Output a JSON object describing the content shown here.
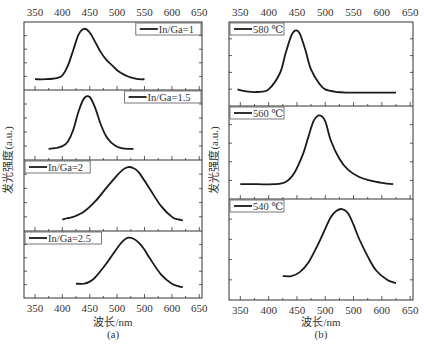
{
  "chart_data": [
    {
      "type": "line",
      "label": "(a)",
      "xlabel": "波长/nm",
      "ylabel": "发光强度(a.u.)",
      "top_ticks": [
        "350",
        "400",
        "450",
        "500",
        "550",
        "600",
        "650"
      ],
      "bottom_ticks": [
        "350",
        "400",
        "450",
        "500",
        "500",
        "600",
        "650"
      ],
      "xlim": [
        330,
        655
      ],
      "grid": false,
      "legend_position": "per-panel",
      "series": [
        {
          "name": "In/Ga=1",
          "legend_side": "right",
          "x": [
            350,
            370,
            390,
            400,
            410,
            420,
            430,
            440,
            450,
            460,
            470,
            480,
            490,
            500,
            510,
            520,
            530,
            540,
            550
          ],
          "y": [
            0.05,
            0.05,
            0.07,
            0.12,
            0.3,
            0.6,
            0.9,
            1.0,
            0.93,
            0.75,
            0.56,
            0.42,
            0.32,
            0.22,
            0.15,
            0.1,
            0.07,
            0.05,
            0.05
          ]
        },
        {
          "name": "In/Ga=1.5",
          "legend_side": "right",
          "x": [
            375,
            390,
            400,
            410,
            420,
            430,
            440,
            450,
            460,
            470,
            480,
            490,
            500,
            510,
            520,
            530
          ],
          "y": [
            0.05,
            0.07,
            0.1,
            0.18,
            0.4,
            0.75,
            0.98,
            1.0,
            0.8,
            0.5,
            0.28,
            0.16,
            0.09,
            0.06,
            0.05,
            0.05
          ]
        },
        {
          "name": "In/Ga=2",
          "legend_side": "left",
          "x": [
            400,
            410,
            420,
            440,
            460,
            480,
            500,
            510,
            520,
            530,
            540,
            560,
            580,
            600,
            610,
            620
          ],
          "y": [
            0.05,
            0.08,
            0.1,
            0.2,
            0.38,
            0.62,
            0.85,
            0.95,
            1.0,
            0.98,
            0.9,
            0.6,
            0.3,
            0.1,
            0.06,
            0.04
          ]
        },
        {
          "name": "In/Ga=2.5",
          "legend_side": "left",
          "x": [
            425,
            440,
            450,
            460,
            480,
            500,
            510,
            520,
            530,
            540,
            550,
            560,
            580,
            600,
            620
          ],
          "y": [
            0.12,
            0.12,
            0.16,
            0.24,
            0.5,
            0.8,
            0.93,
            1.0,
            0.98,
            0.9,
            0.77,
            0.6,
            0.3,
            0.12,
            0.05
          ]
        }
      ]
    },
    {
      "type": "line",
      "label": "(b)",
      "xlabel": "波长/nm",
      "ylabel": "发光强度(a.u.)",
      "top_ticks": [
        "350",
        "400",
        "450",
        "500",
        "550",
        "600",
        "650"
      ],
      "bottom_ticks": [
        "350",
        "400",
        "450",
        "500",
        "500",
        "600",
        "650"
      ],
      "xlim": [
        330,
        655
      ],
      "grid": false,
      "legend_position": "per-panel",
      "series": [
        {
          "name": "580 ℃",
          "legend_side": "left",
          "x": [
            345,
            360,
            380,
            400,
            420,
            430,
            440,
            448,
            455,
            465,
            475,
            490,
            500,
            520,
            540,
            560,
            580,
            600,
            625
          ],
          "y": [
            0.1,
            0.07,
            0.06,
            0.1,
            0.35,
            0.65,
            0.92,
            1.0,
            0.95,
            0.7,
            0.4,
            0.18,
            0.1,
            0.06,
            0.05,
            0.05,
            0.05,
            0.05,
            0.05
          ]
        },
        {
          "name": "560 ℃",
          "legend_side": "left",
          "x": [
            350,
            380,
            410,
            430,
            445,
            460,
            470,
            480,
            490,
            500,
            510,
            525,
            540,
            560,
            580,
            600,
            620
          ],
          "y": [
            0.05,
            0.05,
            0.05,
            0.08,
            0.2,
            0.45,
            0.7,
            0.93,
            1.0,
            0.92,
            0.65,
            0.4,
            0.25,
            0.15,
            0.1,
            0.07,
            0.05
          ]
        },
        {
          "name": "540 ℃",
          "legend_side": "left",
          "x": [
            425,
            440,
            455,
            470,
            485,
            500,
            510,
            520,
            530,
            540,
            550,
            560,
            575,
            590,
            610,
            625
          ],
          "y": [
            0.15,
            0.15,
            0.2,
            0.32,
            0.52,
            0.75,
            0.9,
            0.98,
            1.0,
            0.95,
            0.8,
            0.62,
            0.4,
            0.22,
            0.1,
            0.06
          ]
        }
      ]
    }
  ]
}
